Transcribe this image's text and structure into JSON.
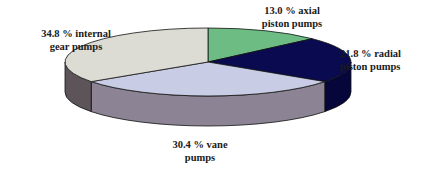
{
  "chart_data": {
    "type": "pie",
    "style": "3d-exploded-none",
    "title": "",
    "slices": [
      {
        "label": "axial piston pumps",
        "value": 13.0,
        "display": "13.0 % axial piston pumps",
        "top_color": "#6cbc84",
        "side_color": "#3c7c54"
      },
      {
        "label": "radial piston pumps",
        "value": 21.8,
        "display": "21.8 % radial piston pumps",
        "top_color": "#0a0a50",
        "side_color": "#06063a"
      },
      {
        "label": "vane pumps",
        "value": 30.4,
        "display": "30.4 % vane pumps",
        "top_color": "#c8cce4",
        "side_color": "#8c8494"
      },
      {
        "label": "internal gear pumps",
        "value": 34.8,
        "display": "34.8 % internal gear pumps",
        "top_color": "#dcdcd4",
        "side_color": "#5c5458"
      }
    ],
    "start_angle_deg": -90,
    "direction": "clockwise",
    "legend": "none",
    "units": "%"
  },
  "labels": {
    "internal": {
      "line1": "34.8 % internal",
      "line2": "gear pumps"
    },
    "axial": {
      "line1": "13.0 % axial",
      "line2": "piston pumps"
    },
    "radial": {
      "line1": "21.8 % radial",
      "line2": "piston pumps"
    },
    "vane": {
      "line1": "30.4 % vane",
      "line2": "pumps"
    }
  }
}
